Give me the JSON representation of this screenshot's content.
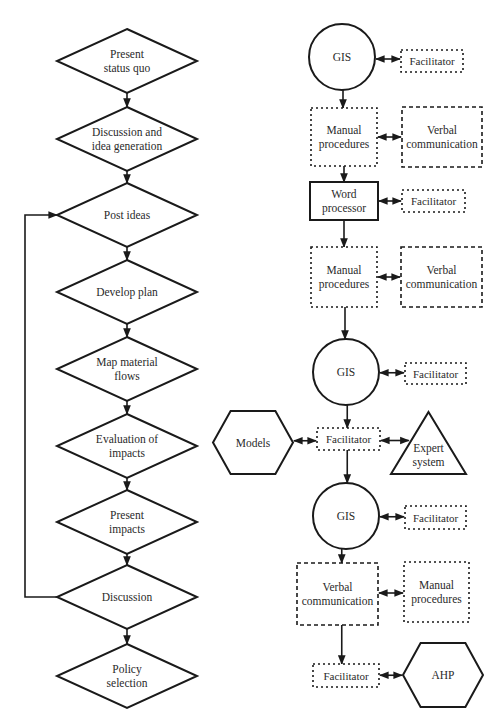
{
  "colors": {
    "stroke": "#1a1a1a",
    "text": "#2a2a2a",
    "background": "#ffffff"
  },
  "left_flow": {
    "nodes": [
      {
        "id": "present-status-quo",
        "label": "Present\nstatus quo",
        "cx": 127,
        "cy": 61,
        "w": 140,
        "h": 64
      },
      {
        "id": "discussion-idea-generation",
        "label": "Discussion and\nidea generation",
        "cx": 127,
        "cy": 139,
        "w": 140,
        "h": 64
      },
      {
        "id": "post-ideas",
        "label": "Post ideas",
        "cx": 127,
        "cy": 215,
        "w": 140,
        "h": 64
      },
      {
        "id": "develop-plan",
        "label": "Develop plan",
        "cx": 127,
        "cy": 292,
        "w": 140,
        "h": 64
      },
      {
        "id": "map-material-flows",
        "label": "Map material\nflows",
        "cx": 127,
        "cy": 369,
        "w": 140,
        "h": 64
      },
      {
        "id": "evaluation-of-impacts",
        "label": "Evaluation of\nimpacts",
        "cx": 127,
        "cy": 446,
        "w": 140,
        "h": 64
      },
      {
        "id": "present-impacts",
        "label": "Present\nimpacts",
        "cx": 127,
        "cy": 522,
        "w": 140,
        "h": 64
      },
      {
        "id": "discussion",
        "label": "Discussion",
        "cx": 127,
        "cy": 597,
        "w": 140,
        "h": 64
      },
      {
        "id": "policy-selection",
        "label": "Policy\nselection",
        "cx": 127,
        "cy": 676,
        "w": 140,
        "h": 64
      }
    ],
    "loop": {
      "from": "discussion",
      "to": "post-ideas",
      "x": 25
    }
  },
  "right_flow": {
    "nodes": [
      {
        "id": "gis-1",
        "type": "circle",
        "label": "GIS",
        "cx": 342,
        "cy": 57,
        "r": 33
      },
      {
        "id": "facilitator-1",
        "type": "dotted",
        "label": "Facilitator",
        "x": 401,
        "y": 50,
        "w": 62,
        "h": 22
      },
      {
        "id": "manual-procedures-1",
        "type": "dotted",
        "label": "Manual\nprocedures",
        "x": 311,
        "y": 108,
        "w": 66,
        "h": 58
      },
      {
        "id": "verbal-communication-1",
        "type": "dashed",
        "label": "Verbal\ncommunication",
        "x": 402,
        "y": 107,
        "w": 80,
        "h": 60
      },
      {
        "id": "word-processor",
        "type": "solid",
        "label": "Word\nprocessor",
        "x": 310,
        "y": 182,
        "w": 68,
        "h": 38
      },
      {
        "id": "facilitator-2",
        "type": "dotted",
        "label": "Facilitator",
        "x": 402,
        "y": 190,
        "w": 63,
        "h": 22
      },
      {
        "id": "manual-procedures-2",
        "type": "dotted",
        "label": "Manual\nprocedures",
        "x": 311,
        "y": 247,
        "w": 66,
        "h": 60
      },
      {
        "id": "verbal-communication-2",
        "type": "dashed",
        "label": "Verbal\ncommunication",
        "x": 401,
        "y": 247,
        "w": 81,
        "h": 60
      },
      {
        "id": "gis-2",
        "type": "circle",
        "label": "GIS",
        "cx": 346,
        "cy": 372,
        "r": 33
      },
      {
        "id": "facilitator-3",
        "type": "dotted",
        "label": "Facilitator",
        "x": 405,
        "y": 363,
        "w": 61,
        "h": 21
      },
      {
        "id": "models",
        "type": "hexagon",
        "label": "Models",
        "x": 213,
        "y": 411,
        "w": 80,
        "h": 63
      },
      {
        "id": "facilitator-4",
        "type": "dotted",
        "label": "Facilitator",
        "x": 317,
        "y": 428,
        "w": 63,
        "h": 22
      },
      {
        "id": "expert-system",
        "type": "triangle",
        "label": "Expert\nsystem",
        "x": 391,
        "y": 412,
        "w": 75,
        "h": 62
      },
      {
        "id": "gis-3",
        "type": "circle",
        "label": "GIS",
        "cx": 346,
        "cy": 516,
        "r": 33
      },
      {
        "id": "facilitator-5",
        "type": "dotted",
        "label": "Facilitator",
        "x": 405,
        "y": 506,
        "w": 61,
        "h": 23
      },
      {
        "id": "verbal-communication-3",
        "type": "dashed",
        "label": "Verbal\ncommunication",
        "x": 297,
        "y": 563,
        "w": 81,
        "h": 62
      },
      {
        "id": "manual-procedures-3",
        "type": "dotted",
        "label": "Manual\nprocedures",
        "x": 404,
        "y": 562,
        "w": 65,
        "h": 60
      },
      {
        "id": "facilitator-6",
        "type": "dotted",
        "label": "Facilitator",
        "x": 313,
        "y": 664,
        "w": 66,
        "h": 23
      },
      {
        "id": "ahp",
        "type": "hexagon",
        "label": "AHP",
        "x": 403,
        "y": 643,
        "w": 80,
        "h": 64
      }
    ],
    "flow_arrows": [
      {
        "from": "gis-1",
        "to": "manual-procedures-1"
      },
      {
        "from": "manual-procedures-1",
        "to": "word-processor"
      },
      {
        "from": "word-processor",
        "to": "manual-procedures-2"
      },
      {
        "from": "manual-procedures-2",
        "to": "gis-2"
      },
      {
        "from": "gis-2",
        "to": "facilitator-4"
      },
      {
        "from": "facilitator-4",
        "to": "gis-3"
      },
      {
        "from": "gis-3",
        "to": "verbal-communication-3"
      },
      {
        "from": "verbal-communication-3",
        "to": "facilitator-6"
      }
    ],
    "bidirectional_links": [
      {
        "a": "gis-1",
        "b": "facilitator-1"
      },
      {
        "a": "manual-procedures-1",
        "b": "verbal-communication-1"
      },
      {
        "a": "word-processor",
        "b": "facilitator-2"
      },
      {
        "a": "manual-procedures-2",
        "b": "verbal-communication-2"
      },
      {
        "a": "gis-2",
        "b": "facilitator-3"
      },
      {
        "a": "models",
        "b": "facilitator-4"
      },
      {
        "a": "facilitator-4",
        "b": "expert-system"
      },
      {
        "a": "gis-3",
        "b": "facilitator-5"
      },
      {
        "a": "verbal-communication-3",
        "b": "manual-procedures-3"
      },
      {
        "a": "facilitator-6",
        "b": "ahp"
      }
    ]
  }
}
